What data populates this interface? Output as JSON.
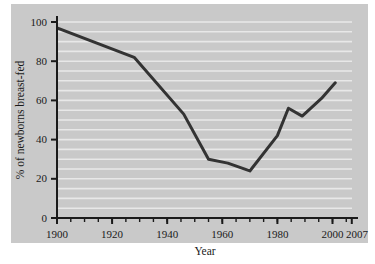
{
  "chart_data": {
    "type": "line",
    "title": "",
    "xlabel": "Year",
    "ylabel": "% of newborns breast-fed",
    "xlim": [
      1900,
      2007
    ],
    "ylim": [
      0,
      100
    ],
    "grid": true,
    "grid_orientation": "horizontal",
    "grid_step": 5,
    "legend": "none",
    "x_major_ticks": [
      1900,
      1920,
      1940,
      1960,
      1980,
      2000,
      2007
    ],
    "x_major_tick_labels": [
      "1900",
      "1920",
      "1940",
      "1960",
      "1980",
      "2000",
      "2007"
    ],
    "x_minor_tick_step": 5,
    "y_major_ticks": [
      0,
      20,
      40,
      60,
      80,
      100
    ],
    "y_major_tick_labels": [
      "0",
      "20",
      "40",
      "60",
      "80",
      "100"
    ],
    "series": [
      {
        "name": "% of newborns breast-fed",
        "color": "#333333",
        "line_width": 3,
        "x": [
          1900,
          1928,
          1946,
          1955,
          1962,
          1970,
          1980,
          1984,
          1989,
          1996,
          2001
        ],
        "values": [
          97,
          82,
          53,
          30,
          28,
          24,
          42,
          56,
          52,
          61,
          69
        ]
      }
    ]
  },
  "colors": {
    "panel_background": "#c9c9c9",
    "gridline": "#e8e8e8",
    "axis": "#1a1a1a",
    "line": "#333333",
    "page_background": "#ffffff"
  }
}
